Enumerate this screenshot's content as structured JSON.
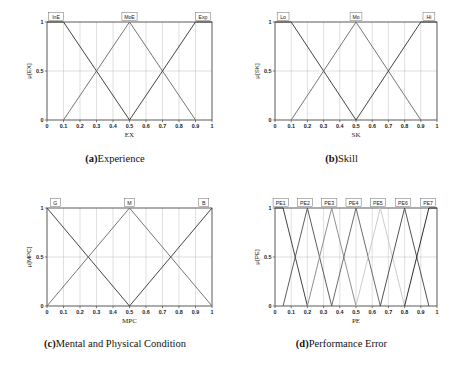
{
  "figure": {
    "panels": [
      {
        "id": "a",
        "caption_tag": "(a)",
        "caption_text": "Experience",
        "chart_data": {
          "type": "line",
          "title": "",
          "xlabel": "EX",
          "ylabel": "μ[EX]",
          "xlim": [
            0,
            1
          ],
          "ylim": [
            0,
            1
          ],
          "xticks": [
            "0",
            "0.1",
            "0.2",
            "0.3",
            "0.4",
            "0.5",
            "0.6",
            "0.7",
            "0.8",
            "0.9",
            "1"
          ],
          "yticks": [
            "0",
            "0.5",
            "1"
          ],
          "grid": true,
          "legend_position": "inside-top",
          "series": [
            {
              "name": "InE",
              "label_x": 0.055,
              "color": "#3a3a3a",
              "points": [
                [
                  0,
                  1
                ],
                [
                  0.1,
                  1
                ],
                [
                  0.5,
                  0
                ]
              ]
            },
            {
              "name": "MoE",
              "label_x": 0.5,
              "color": "#6e6e6e",
              "points": [
                [
                  0.1,
                  0
                ],
                [
                  0.5,
                  1
                ],
                [
                  0.9,
                  0
                ]
              ]
            },
            {
              "name": "Exp",
              "label_x": 0.945,
              "color": "#3a3a3a",
              "points": [
                [
                  0.5,
                  0
                ],
                [
                  0.9,
                  1
                ],
                [
                  1,
                  1
                ]
              ]
            }
          ]
        }
      },
      {
        "id": "b",
        "caption_tag": "(b)",
        "caption_text": "Skill",
        "chart_data": {
          "type": "line",
          "title": "",
          "xlabel": "SK",
          "ylabel": "μ[SK]",
          "xlim": [
            0,
            1
          ],
          "ylim": [
            0,
            1
          ],
          "xticks": [
            "0",
            "0.1",
            "0.2",
            "0.3",
            "0.4",
            "0.5",
            "0.6",
            "0.7",
            "0.8",
            "0.9",
            "1"
          ],
          "yticks": [
            "0",
            "0.5",
            "1"
          ],
          "grid": true,
          "legend_position": "inside-top",
          "series": [
            {
              "name": "Lo",
              "label_x": 0.05,
              "color": "#3a3a3a",
              "points": [
                [
                  0,
                  1
                ],
                [
                  0.1,
                  1
                ],
                [
                  0.5,
                  0
                ]
              ]
            },
            {
              "name": "Mo",
              "label_x": 0.5,
              "color": "#6e6e6e",
              "points": [
                [
                  0.1,
                  0
                ],
                [
                  0.5,
                  1
                ],
                [
                  0.9,
                  0
                ]
              ]
            },
            {
              "name": "Hi",
              "label_x": 0.95,
              "color": "#3a3a3a",
              "points": [
                [
                  0.5,
                  0
                ],
                [
                  0.9,
                  1
                ],
                [
                  1,
                  1
                ]
              ]
            }
          ]
        }
      },
      {
        "id": "c",
        "caption_tag": "(c)",
        "caption_text": "Mental and Physical Condition",
        "chart_data": {
          "type": "line",
          "title": "",
          "xlabel": "MPC",
          "ylabel": "μ[MPC]",
          "xlim": [
            0,
            1
          ],
          "ylim": [
            0,
            1
          ],
          "xticks": [
            "0",
            "0.1",
            "0.2",
            "0.3",
            "0.4",
            "0.5",
            "0.6",
            "0.7",
            "0.8",
            "0.9",
            "1"
          ],
          "yticks": [
            "0",
            "0.5",
            "1"
          ],
          "grid": true,
          "legend_position": "inside-top",
          "series": [
            {
              "name": "G",
              "label_x": 0.05,
              "color": "#3a3a3a",
              "points": [
                [
                  0,
                  1
                ],
                [
                  0.5,
                  0
                ]
              ]
            },
            {
              "name": "M",
              "label_x": 0.5,
              "color": "#6e6e6e",
              "points": [
                [
                  0,
                  0
                ],
                [
                  0.5,
                  1
                ],
                [
                  1,
                  0
                ]
              ]
            },
            {
              "name": "B",
              "label_x": 0.95,
              "color": "#3a3a3a",
              "points": [
                [
                  0.5,
                  0
                ],
                [
                  1,
                  1
                ]
              ]
            }
          ]
        }
      },
      {
        "id": "d",
        "caption_tag": "(d)",
        "caption_text": "Performance Error",
        "chart_data": {
          "type": "line",
          "title": "",
          "xlabel": "PE",
          "ylabel": "μ[PE]",
          "xlim": [
            0,
            1
          ],
          "ylim": [
            0,
            1
          ],
          "xticks": [
            "0",
            "0.1",
            "0.2",
            "0.3",
            "0.4",
            "0.5",
            "0.6",
            "0.7",
            "0.8",
            "0.9",
            "1"
          ],
          "yticks": [
            "0",
            "0.5",
            "1"
          ],
          "grid": true,
          "legend_position": "inside-top",
          "series": [
            {
              "name": "PE1",
              "label_x": 0.035,
              "color": "#3a3a3a",
              "points": [
                [
                  0,
                  1
                ],
                [
                  0.05,
                  1
                ],
                [
                  0.2,
                  0
                ]
              ]
            },
            {
              "name": "PE2",
              "label_x": 0.185,
              "color": "#555555",
              "points": [
                [
                  0.05,
                  0
                ],
                [
                  0.2,
                  1
                ],
                [
                  0.35,
                  0
                ]
              ]
            },
            {
              "name": "PE3",
              "label_x": 0.335,
              "color": "#8a8a8a",
              "points": [
                [
                  0.2,
                  0
                ],
                [
                  0.35,
                  1
                ],
                [
                  0.5,
                  0
                ]
              ]
            },
            {
              "name": "PE4",
              "label_x": 0.485,
              "color": "#666666",
              "points": [
                [
                  0.35,
                  0
                ],
                [
                  0.5,
                  1
                ],
                [
                  0.65,
                  0
                ]
              ]
            },
            {
              "name": "PE5",
              "label_x": 0.635,
              "color": "#c8c8c8",
              "points": [
                [
                  0.5,
                  0
                ],
                [
                  0.65,
                  1
                ],
                [
                  0.8,
                  0
                ]
              ]
            },
            {
              "name": "PE6",
              "label_x": 0.79,
              "color": "#4a4a4a",
              "points": [
                [
                  0.65,
                  0
                ],
                [
                  0.8,
                  1
                ],
                [
                  0.95,
                  0
                ]
              ]
            },
            {
              "name": "PE7",
              "label_x": 0.945,
              "color": "#222222",
              "points": [
                [
                  0.8,
                  0
                ],
                [
                  0.95,
                  1
                ],
                [
                  1,
                  1
                ]
              ]
            }
          ]
        }
      }
    ]
  }
}
